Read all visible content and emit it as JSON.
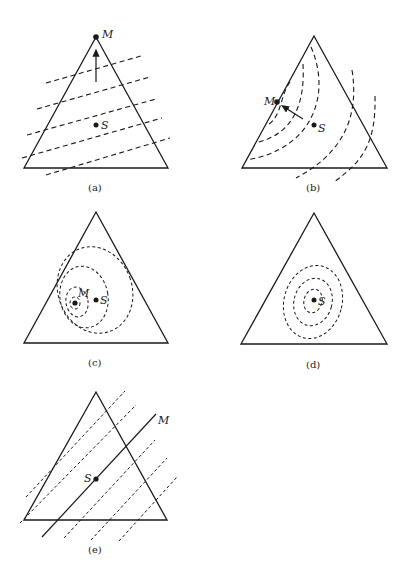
{
  "panels": [
    {
      "id": "a",
      "caption": "(a)",
      "labels": {
        "M": "M",
        "S": "S"
      },
      "description": "Parallel dashed contour lines; arrow pointing up toward optimum M at apex"
    },
    {
      "id": "b",
      "caption": "(b)",
      "labels": {
        "M": "M",
        "S": "S"
      },
      "description": "Curved dashed contours; optimum M on left edge; arrow from S toward M"
    },
    {
      "id": "c",
      "caption": "(c)",
      "labels": {
        "M": "M",
        "S": "S"
      },
      "description": "Closed elliptical dashed contours centered at M, near S"
    },
    {
      "id": "d",
      "caption": "(d)",
      "labels": {
        "S": "S"
      },
      "description": "Closed elliptical dashed contours centered at S"
    },
    {
      "id": "e",
      "caption": "(e)",
      "labels": {
        "M": "M",
        "S": "S"
      },
      "description": "Parallel diagonal dashed contours with solid ridge line M through S"
    }
  ]
}
